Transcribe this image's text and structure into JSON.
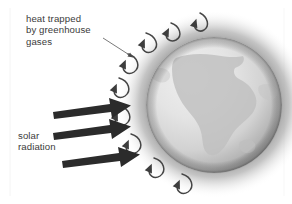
{
  "diagram": {
    "labels": {
      "heat_trapped": "heat trapped\nby greenhouse\ngases",
      "solar_radiation": "solar\nradiation"
    },
    "features": {
      "planet": "earth-globe",
      "continent": "africa",
      "atmosphere": "greenhouse-gas-halo",
      "incoming_arrow_count": 3,
      "trapped_heat_arrow_count": 8
    },
    "colors": {
      "text": "#3b3b3b",
      "arrow_solar": "#2b2b2b",
      "arrow_heat": "#4a4a4a",
      "globe_light": "#e8e8e8",
      "globe_mid": "#c9c9c9",
      "globe_dark": "#9a9a9a",
      "continent": "#bdbdbd",
      "halo": "#8f8f8f",
      "background": "#ffffff"
    }
  }
}
